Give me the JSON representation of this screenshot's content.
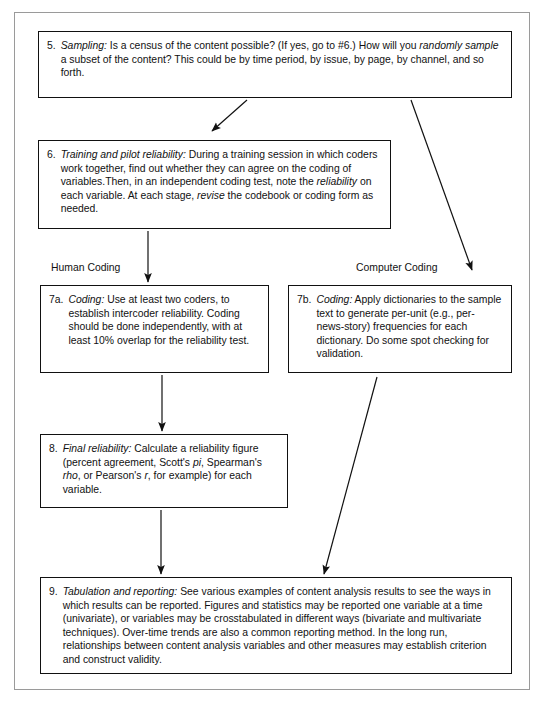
{
  "figure": {
    "type": "flowchart",
    "title": "",
    "orientation": "top-to-bottom",
    "frame_color": "#9a9a9a",
    "box_border_color": "#111111",
    "background": "#ffffff"
  },
  "captions": {
    "human_coding": "Human Coding",
    "computer_coding": "Computer Coding"
  },
  "nodes": {
    "step5": {
      "number": "5.",
      "lead": "Sampling:",
      "text": " Is a census of the content possible? (If yes, go to #6.) How will you ",
      "lead2": "randomly sample",
      "text2": " a subset of the content? This could be by time period, by issue, by page, by channel, and so forth."
    },
    "step6": {
      "number": "6.",
      "lead": "Training and pilot reliability:",
      "text": " During a training session in which coders work together, find out whether they can agree on the coding of variables.Then, in an independent coding test, note the ",
      "lead2": "reliability",
      "text2": " on each variable. At each stage, ",
      "lead3": "revise",
      "text3": " the codebook or coding form as needed."
    },
    "step7a": {
      "number": "7a.",
      "lead": "Coding:",
      "text": " Use at least two coders, to establish intercoder reliability. Coding should be done independently, with at least 10% overlap for the reliability test."
    },
    "step7b": {
      "number": "7b.",
      "lead": "Coding:",
      "text": " Apply dictionaries to the sample text to generate per-unit (e.g., per-news-story) frequencies for each dictionary. Do some spot checking for validation."
    },
    "step8": {
      "number": "8.",
      "lead": "Final reliability:",
      "text": " Calculate a reliability figure (percent agreement, Scott's ",
      "lead2": "pi",
      "text2": ", Spearman's ",
      "lead3": "rho",
      "text3": ", or Pearson's ",
      "lead4": "r",
      "text4": ", for example) for each variable."
    },
    "step9": {
      "number": "9.",
      "lead": "Tabulation and reporting:",
      "text": " See various examples of content analysis results to see the ways in which results can be reported. Figures and statistics may be reported one variable at a time (univariate), or variables may be crosstabulated in different ways (bivariate and multivariate techniques). Over-time trends are also a common reporting method. In the long run, relationships between content analysis variables and other measures may establish criterion and construct validity."
    }
  },
  "edges": [
    {
      "name": "step5-to-step6",
      "from": "step5",
      "to": "step6",
      "style": "diagonal-down-left"
    },
    {
      "name": "step5-to-step7b",
      "from": "step5",
      "to": "step7b",
      "style": "diagonal-down-right"
    },
    {
      "name": "step6-to-step7a",
      "from": "step6",
      "to": "step7a",
      "style": "vertical"
    },
    {
      "name": "step7a-to-step8",
      "from": "step7a",
      "to": "step8",
      "style": "vertical"
    },
    {
      "name": "step8-to-step9",
      "from": "step8",
      "to": "step9",
      "style": "vertical"
    },
    {
      "name": "step7b-to-step9",
      "from": "step7b",
      "to": "step9",
      "style": "diagonal-down-left"
    }
  ]
}
